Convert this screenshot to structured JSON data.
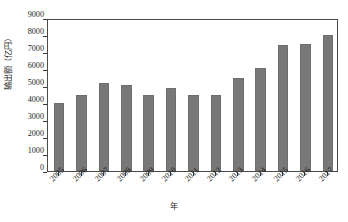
{
  "chart_data": {
    "type": "bar",
    "title": "",
    "subtitle": "",
    "xlabel": "年",
    "ylabel": "输出额（亿円）",
    "categories": [
      "2005",
      "2006",
      "2007",
      "2008",
      "2009",
      "2010",
      "2011",
      "2012",
      "2013",
      "2014",
      "2015",
      "2016",
      "2017"
    ],
    "values": [
      4000,
      4500,
      5150,
      5080,
      4450,
      4900,
      4500,
      4490,
      5480,
      6050,
      7400,
      7450,
      8030
    ],
    "series": [
      {
        "name": "输出额",
        "values": [
          4000,
          4500,
          5150,
          5080,
          4450,
          4900,
          4500,
          4490,
          5480,
          6050,
          7400,
          7450,
          8030
        ]
      }
    ],
    "ylim": [
      0,
      9000
    ],
    "y_ticks": [
      0,
      1000,
      2000,
      3000,
      4000,
      5000,
      6000,
      7000,
      8000,
      9000
    ],
    "y_tick_labels": [
      "0",
      "1000",
      "2000",
      "3000",
      "4000",
      "5000",
      "6000",
      "7000",
      "8000",
      "9000"
    ],
    "grid": false,
    "legend": false,
    "legend_position": "none",
    "bar_color": "#787878",
    "frame_color": "#4a4a4a",
    "text_color": "#1f1f1f",
    "background": "#ffffff",
    "x_tick_label_rotation": -45,
    "annotations": []
  }
}
